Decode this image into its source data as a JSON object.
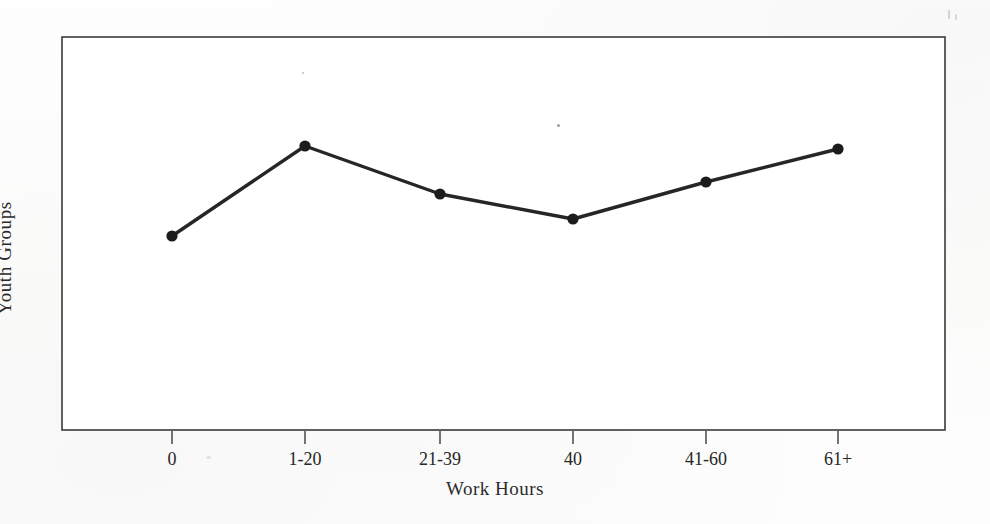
{
  "chart_data": {
    "type": "line",
    "title": "",
    "subtitle": "",
    "xlabel": "Work Hours",
    "ylabel": "Youth Groups",
    "categories": [
      "0",
      "1-20",
      "21-39",
      "40",
      "41-60",
      "61+"
    ],
    "values": [
      0.49,
      0.72,
      0.6,
      0.54,
      0.63,
      0.72
    ],
    "series": [
      {
        "name": "Youth Groups",
        "values": [
          0.49,
          0.72,
          0.6,
          0.54,
          0.63,
          0.72
        ]
      }
    ],
    "point_pixels": [
      {
        "category": "0",
        "x": 172,
        "y": 236
      },
      {
        "category": "1-20",
        "x": 305,
        "y": 146
      },
      {
        "category": "21-39",
        "x": 440,
        "y": 194
      },
      {
        "category": "40",
        "x": 573,
        "y": 219
      },
      {
        "category": "41-60",
        "x": 706,
        "y": 182
      },
      {
        "category": "61+",
        "x": 838,
        "y": 149
      }
    ],
    "ylim": [
      0,
      1
    ],
    "y_tick_labels": [],
    "grid": false,
    "legend": false,
    "legend_position": "none",
    "marker": "filled-circle",
    "line_color": "#262626",
    "marker_color": "#1c1c1c",
    "frame_color": "#3a3a3a",
    "background_color": "#fdfdfc",
    "plot_frame": {
      "left": 62,
      "top": 37,
      "right": 945,
      "bottom": 430
    },
    "annotations": []
  },
  "axis": {
    "x_title": "Work Hours",
    "y_title": "Youth Groups",
    "x_ticks": [
      "0",
      "1-20",
      "21-39",
      "40",
      "41-60",
      "61+"
    ]
  }
}
